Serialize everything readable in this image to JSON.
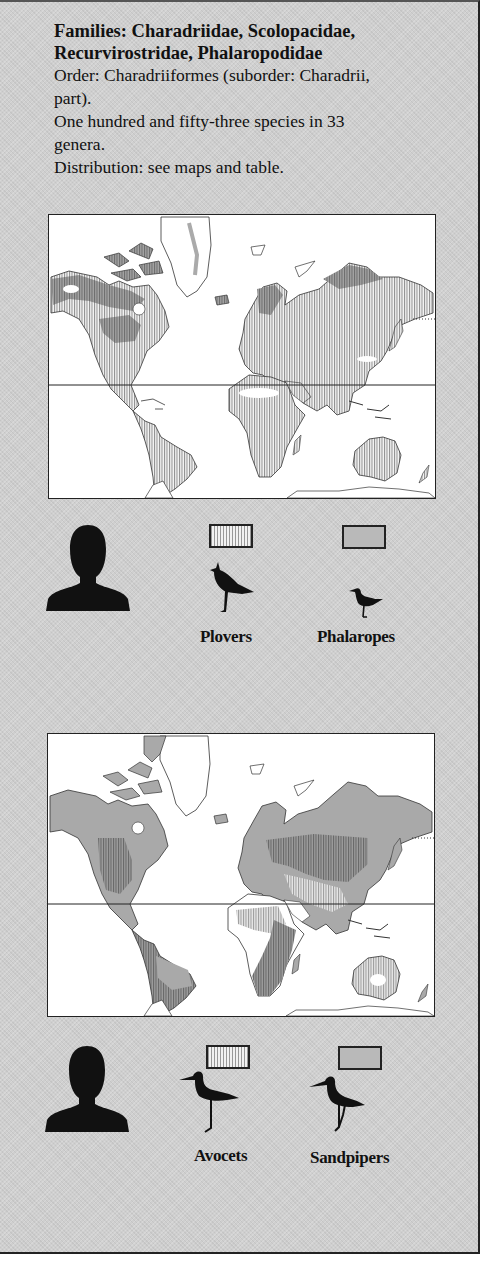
{
  "header": {
    "title_line1": "Families: Charadriidae, Scolopacidae,",
    "title_line2": "Recurvirostridae, Phalaropodidae",
    "order_line1": "Order: Charadriiformes (suborder: Charadrii,",
    "order_line2": "part).",
    "species_line1": "One hundred and fifty-three species in 33",
    "species_line2": "genera.",
    "distribution": "Distribution: see maps and table."
  },
  "maps": [
    {
      "name": "map-plovers-phalaropes",
      "legend": [
        {
          "label": "Plovers",
          "pattern": "vertical-hatch",
          "icon": "plover-silhouette-icon"
        },
        {
          "label": "Phalaropes",
          "pattern": "grey-fill",
          "icon": "phalarope-silhouette-icon"
        }
      ],
      "scale_icon": "human-silhouette-icon"
    },
    {
      "name": "map-avocets-sandpipers",
      "legend": [
        {
          "label": "Avocets",
          "pattern": "vertical-hatch",
          "icon": "avocet-silhouette-icon"
        },
        {
          "label": "Sandpipers",
          "pattern": "grey-fill",
          "icon": "sandpiper-silhouette-icon"
        }
      ],
      "scale_icon": "human-silhouette-icon"
    }
  ],
  "colors": {
    "panel": "#cfcfcf",
    "hatch": "#9a9a9a",
    "grey_range": "#a9a9a9",
    "ink": "#111111"
  }
}
